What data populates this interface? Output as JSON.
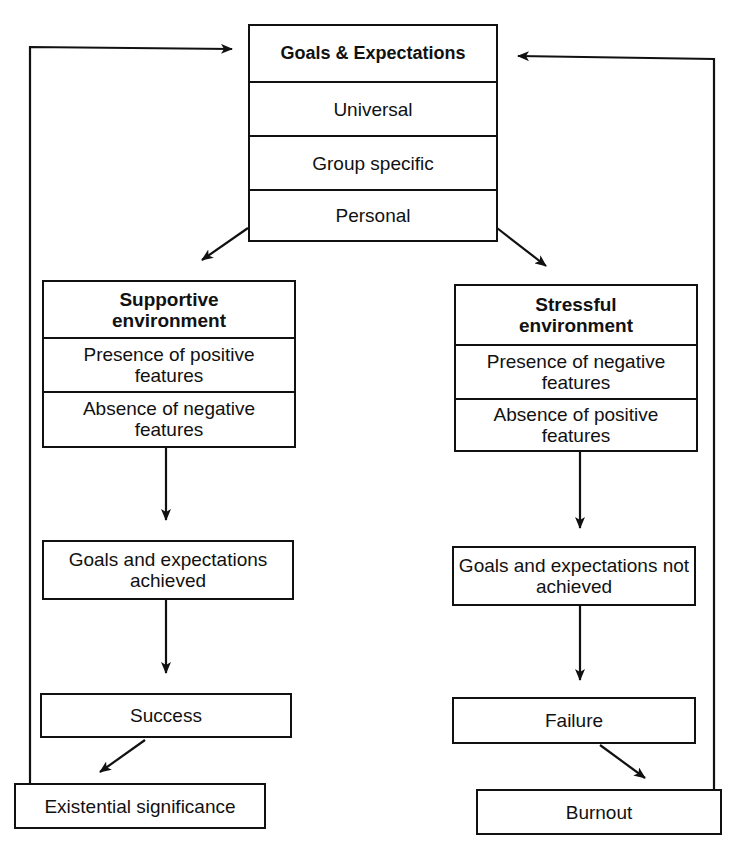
{
  "diagram": {
    "top_box": {
      "title": "Goals & Expectations",
      "rows": [
        "Universal",
        "Group specific",
        "Personal"
      ]
    },
    "left_branch": {
      "environment": {
        "title": "Supportive environment",
        "rows": [
          "Presence of positive features",
          "Absence of negative features"
        ]
      },
      "outcome": "Goals and expectations achieved",
      "result": "Success",
      "final": "Existential significance"
    },
    "right_branch": {
      "environment": {
        "title": "Stressful environment",
        "rows": [
          "Presence of negative features",
          "Absence of positive features"
        ]
      },
      "outcome": "Goals and expectations not achieved",
      "result": "Failure",
      "final": "Burnout"
    },
    "colors": {
      "line": "#111111",
      "background": "#ffffff"
    }
  }
}
